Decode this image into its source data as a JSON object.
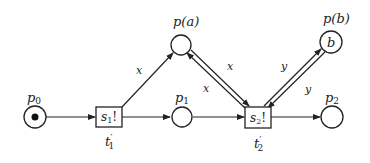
{
  "diagram": {
    "type": "petri-net",
    "places": [
      {
        "id": "p0",
        "label": "p",
        "sub": "0",
        "token": true,
        "cx": 35,
        "cy": 117
      },
      {
        "id": "pa",
        "label": "p(a)",
        "token": false,
        "cx": 181,
        "cy": 45
      },
      {
        "id": "p1",
        "label": "p",
        "sub": "1",
        "token": false,
        "cx": 182,
        "cy": 117
      },
      {
        "id": "pb",
        "label": "p(b)",
        "inner": "b",
        "token": false,
        "cx": 331,
        "cy": 42
      },
      {
        "id": "p2",
        "label": "p",
        "sub": "2",
        "token": false,
        "cx": 332,
        "cy": 117
      }
    ],
    "transitions": [
      {
        "id": "t1",
        "text": "s",
        "text_sub": "1",
        "text_suffix": "!",
        "label": "t",
        "label_sub": "1",
        "label_prime": "′"
      },
      {
        "id": "t2",
        "text": "s",
        "text_sub": "2",
        "text_suffix": "!",
        "label": "t",
        "label_sub": "2",
        "label_prime": "′"
      }
    ],
    "arc_labels": {
      "t1_to_pa": "x",
      "t2_to_pa": "x",
      "pa_to_t2": "x",
      "t2_to_pb": "y",
      "pb_to_t2": "y"
    }
  }
}
